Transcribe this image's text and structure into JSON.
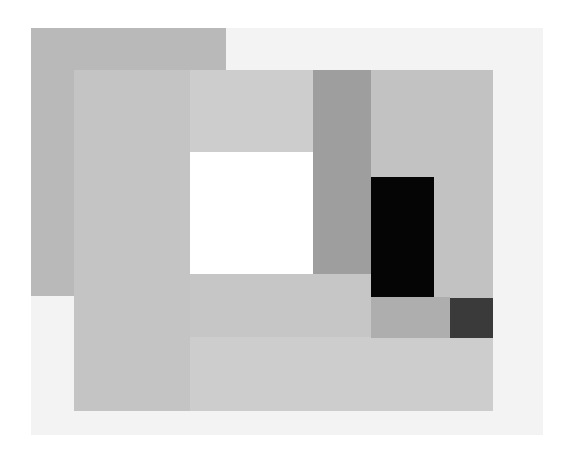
{
  "artwork": {
    "description": "Abstract geometric composition of overlapping grayscale rectangles",
    "shapes": [
      {
        "name": "canvas-offwhite",
        "x": 31,
        "y": 28,
        "w": 512,
        "h": 407,
        "color": "#f3f3f3"
      },
      {
        "name": "outer-gray-block",
        "x": 31,
        "y": 28,
        "w": 195,
        "h": 268,
        "color": "#b9b9b9"
      },
      {
        "name": "main-panel",
        "x": 74,
        "y": 70,
        "w": 419,
        "h": 341,
        "color": "#cdcdcd"
      },
      {
        "name": "left-column",
        "x": 74,
        "y": 70,
        "w": 116,
        "h": 341,
        "color": "#c4c4c4"
      },
      {
        "name": "inner-light-rect",
        "x": 190,
        "y": 274,
        "w": 181,
        "h": 63,
        "color": "#c6c6c6"
      },
      {
        "name": "white-square",
        "x": 190,
        "y": 152,
        "w": 123,
        "h": 122,
        "color": "#ffffff"
      },
      {
        "name": "dark-gray-column",
        "x": 313,
        "y": 70,
        "w": 58,
        "h": 204,
        "color": "#9e9e9e"
      },
      {
        "name": "right-gray-panel",
        "x": 371,
        "y": 70,
        "w": 122,
        "h": 268,
        "color": "#c2c2c2"
      },
      {
        "name": "black-rect",
        "x": 371,
        "y": 177,
        "w": 63,
        "h": 120,
        "color": "#050505"
      },
      {
        "name": "mid-gray-strip",
        "x": 371,
        "y": 297,
        "w": 79,
        "h": 41,
        "color": "#aeaeae"
      },
      {
        "name": "charcoal-square",
        "x": 450,
        "y": 298,
        "w": 43,
        "h": 40,
        "color": "#3a3a3a"
      }
    ]
  }
}
